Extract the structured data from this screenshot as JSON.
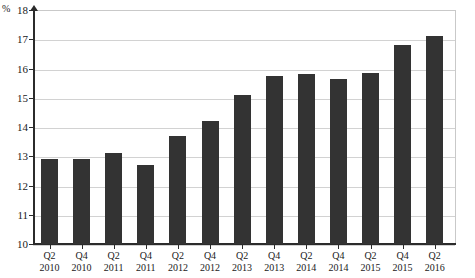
{
  "chart_data": {
    "type": "bar",
    "title": "",
    "subtitle": "",
    "xlabel": "",
    "ylabel": "%",
    "unit_label": "%",
    "ylim": [
      10,
      18
    ],
    "ytick_step": 1,
    "yticks": [
      18,
      17,
      16,
      15,
      14,
      13,
      12,
      11,
      10
    ],
    "grid": true,
    "legend": null,
    "legend_position": "none",
    "bar_color": "#333333",
    "grid_color": "#d2d2d2",
    "axis_color": "#2b2b2b",
    "categories": [
      "Q2 2010",
      "Q4 2010",
      "Q2 2011",
      "Q4 2011",
      "Q2 2012",
      "Q4 2012",
      "Q2 2013",
      "Q4 2013",
      "Q2 2014",
      "Q4 2014",
      "Q2 2015",
      "Q4 2015",
      "Q2 2016"
    ],
    "category_parts": [
      {
        "quarter": "Q2",
        "year": "2010"
      },
      {
        "quarter": "Q4",
        "year": "2010"
      },
      {
        "quarter": "Q2",
        "year": "2011"
      },
      {
        "quarter": "Q4",
        "year": "2011"
      },
      {
        "quarter": "Q2",
        "year": "2012"
      },
      {
        "quarter": "Q4",
        "year": "2012"
      },
      {
        "quarter": "Q2",
        "year": "2013"
      },
      {
        "quarter": "Q4",
        "year": "2013"
      },
      {
        "quarter": "Q2",
        "year": "2014"
      },
      {
        "quarter": "Q4",
        "year": "2014"
      },
      {
        "quarter": "Q2",
        "year": "2015"
      },
      {
        "quarter": "Q4",
        "year": "2015"
      },
      {
        "quarter": "Q2",
        "year": "2016"
      }
    ],
    "values": [
      12.9,
      12.9,
      13.1,
      12.7,
      13.7,
      14.2,
      15.1,
      15.75,
      15.8,
      15.65,
      15.85,
      16.8,
      17.1
    ]
  }
}
